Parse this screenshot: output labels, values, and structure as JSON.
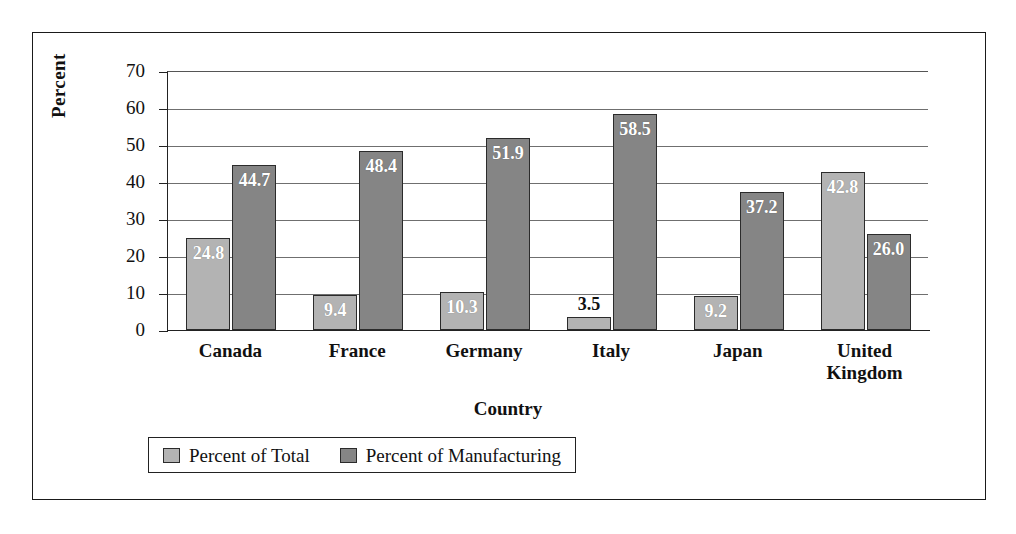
{
  "chart_data": {
    "type": "bar",
    "title": "",
    "xlabel": "Country",
    "ylabel": "Percent",
    "ylim": [
      0,
      70
    ],
    "ytick_step": 10,
    "yticks": [
      "70",
      "60",
      "50",
      "40",
      "30",
      "20",
      "10",
      "0"
    ],
    "grid": true,
    "legend_position": "bottom",
    "categories": [
      "Canada",
      "France",
      "Germany",
      "Italy",
      "Japan",
      "United Kingdom"
    ],
    "series": [
      {
        "name": "Percent of Total",
        "color": "#b3b3b3",
        "values": [
          24.8,
          9.4,
          10.3,
          3.5,
          9.2,
          42.8
        ],
        "labels": [
          "24.8",
          "9.4",
          "10.3",
          "3.5",
          "9.2",
          "42.8"
        ]
      },
      {
        "name": "Percent of Manufacturing",
        "color": "#858585",
        "values": [
          44.7,
          48.4,
          51.9,
          58.5,
          37.2,
          26.0
        ],
        "labels": [
          "44.7",
          "48.4",
          "51.9",
          "58.5",
          "37.2",
          "26.0"
        ]
      }
    ]
  },
  "categories_display": [
    {
      "line1": "Canada",
      "line2": ""
    },
    {
      "line1": "France",
      "line2": ""
    },
    {
      "line1": "Germany",
      "line2": ""
    },
    {
      "line1": "Italy",
      "line2": ""
    },
    {
      "line1": "Japan",
      "line2": ""
    },
    {
      "line1": "United",
      "line2": "Kingdom"
    }
  ]
}
